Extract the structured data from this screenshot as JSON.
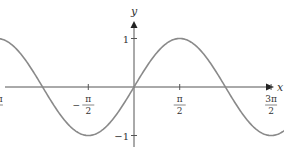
{
  "chart_data": {
    "type": "line",
    "title": "",
    "xlabel": "x",
    "ylabel": "y",
    "function": "y = sin(x)",
    "xlim": [
      -7.85,
      8.6
    ],
    "ylim": [
      -1.2,
      1.3
    ],
    "grid": false,
    "x_ticks": [
      {
        "value": -7.854,
        "num": "5π",
        "den": "2",
        "sign": "−"
      },
      {
        "value": -4.712,
        "num": "3π",
        "den": "2",
        "sign": "−"
      },
      {
        "value": -1.571,
        "num": "π",
        "den": "2",
        "sign": "−"
      },
      {
        "value": 1.571,
        "num": "π",
        "den": "2",
        "sign": ""
      },
      {
        "value": 4.712,
        "num": "3π",
        "den": "2",
        "sign": ""
      },
      {
        "value": 7.854,
        "num": "5π",
        "den": "2",
        "sign": ""
      }
    ],
    "y_ticks": [
      {
        "value": 1,
        "label": "1"
      },
      {
        "value": -1,
        "label": "−1"
      }
    ],
    "series": [
      {
        "name": "sin(x)",
        "color": "#8a8a8a",
        "x": [
          -7.854,
          -6.283,
          -4.712,
          -3.142,
          -1.571,
          0,
          1.571,
          3.142,
          4.712,
          6.283,
          7.854
        ],
        "y": [
          -1,
          0,
          1,
          0,
          -1,
          0,
          1,
          0,
          -1,
          0,
          1
        ]
      }
    ]
  }
}
